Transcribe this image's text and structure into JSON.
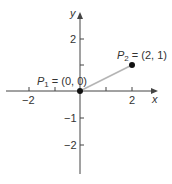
{
  "diagram": {
    "type": "coordinate-plane",
    "axes": {
      "x_label": "x",
      "y_label": "y",
      "x_ticks": [
        -2,
        -1,
        1,
        2
      ],
      "x_tick_labels": [
        "−2",
        "2"
      ],
      "y_ticks": [
        -2,
        -1,
        1,
        2
      ],
      "y_tick_labels": [
        "2",
        "−1",
        "−2"
      ]
    },
    "points": [
      {
        "name": "P",
        "subscript": "1",
        "rest": " = (0, 0)",
        "x": 0,
        "y": 0
      },
      {
        "name": "P",
        "subscript": "2",
        "rest": " = (2, 1)",
        "x": 2,
        "y": 1
      }
    ],
    "segment": {
      "from": "P1",
      "to": "P2",
      "color": "#b5b5b5"
    },
    "colors": {
      "axis": "#444444",
      "point": "#111111",
      "segment": "#b5b5b5"
    }
  }
}
